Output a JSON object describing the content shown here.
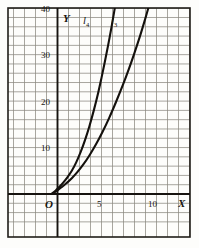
{
  "chart_data": {
    "type": "line",
    "title": "",
    "subtitle": "",
    "xlabel": "X",
    "ylabel": "Y",
    "xlim": [
      -4,
      12.2
    ],
    "ylim": [
      -5,
      40
    ],
    "grid": true,
    "grid_step_x": 1,
    "grid_step_y": 2,
    "legend": "inline-curve-labels",
    "origin_label": "O",
    "x_ticks": [
      {
        "value": 5,
        "label": "5"
      },
      {
        "value": 10,
        "label": "10"
      }
    ],
    "y_ticks": [
      {
        "value": 10,
        "label": "10"
      },
      {
        "value": 20,
        "label": "20"
      },
      {
        "value": 30,
        "label": "30"
      },
      {
        "value": 40,
        "label": "40"
      }
    ],
    "series": [
      {
        "name": "l4",
        "label_base": "l",
        "label_sub": "4",
        "points": [
          [
            -0.55,
            0.0
          ],
          [
            -0.35,
            0.35
          ],
          [
            -0.1,
            0.9
          ],
          [
            0.2,
            1.6
          ],
          [
            0.5,
            2.4
          ],
          [
            0.9,
            3.6
          ],
          [
            1.3,
            5.0
          ],
          [
            1.7,
            6.8
          ],
          [
            2.1,
            9.0
          ],
          [
            2.5,
            11.6
          ],
          [
            2.9,
            14.6
          ],
          [
            3.3,
            18.0
          ],
          [
            3.7,
            21.8
          ],
          [
            4.0,
            25.0
          ],
          [
            4.3,
            28.4
          ],
          [
            4.6,
            32.0
          ],
          [
            4.9,
            35.8
          ],
          [
            5.15,
            39.2
          ],
          [
            5.25,
            40.6
          ]
        ]
      },
      {
        "name": "l3",
        "label_base": "l",
        "label_sub": "3",
        "points": [
          [
            -0.55,
            0.0
          ],
          [
            -0.3,
            0.3
          ],
          [
            0.0,
            0.8
          ],
          [
            0.4,
            1.5
          ],
          [
            0.8,
            2.3
          ],
          [
            1.3,
            3.4
          ],
          [
            1.8,
            4.7
          ],
          [
            2.3,
            6.2
          ],
          [
            2.9,
            8.3
          ],
          [
            3.5,
            10.7
          ],
          [
            4.1,
            13.4
          ],
          [
            4.7,
            16.4
          ],
          [
            5.3,
            19.7
          ],
          [
            5.9,
            23.2
          ],
          [
            6.5,
            27.0
          ],
          [
            7.0,
            30.4
          ],
          [
            7.5,
            34.0
          ],
          [
            7.9,
            37.1
          ],
          [
            8.3,
            40.4
          ]
        ]
      }
    ],
    "curve_labels": [
      {
        "series": "l4",
        "base": "l",
        "sub": "4"
      },
      {
        "series": "l3",
        "base": "l",
        "sub": "3"
      }
    ]
  },
  "figure": {
    "x_axis_name": "X",
    "y_axis_name": "Y",
    "origin": "O",
    "tick_5": "5",
    "tick_10": "10",
    "tick_y10": "10",
    "tick_y20": "20",
    "tick_y30": "30",
    "tick_y40": "40",
    "curve1_base": "l",
    "curve1_sub": "4",
    "curve2_base": "l",
    "curve2_sub": "3"
  },
  "colors": {
    "ink": "#14110d",
    "grid": "#8b8880",
    "grid_major": "#5d5a53",
    "paper": "#fdfdfb",
    "border": "#201d18"
  }
}
